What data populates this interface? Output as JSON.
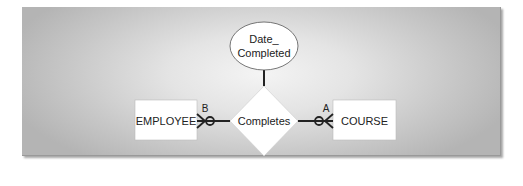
{
  "diagram": {
    "type": "ER diagram (crow's foot notation)",
    "entities": [
      {
        "id": "employee",
        "label": "EMPLOYEE"
      },
      {
        "id": "course",
        "label": "COURSE"
      }
    ],
    "relationship": {
      "id": "completes",
      "label": "Completes"
    },
    "attribute": {
      "id": "date_completed",
      "line1": "Date_",
      "line2": "Completed"
    },
    "cardinality_labels": {
      "employee_side": "B",
      "course_side": "A"
    },
    "connections": [
      {
        "from": "employee",
        "to": "completes",
        "notation": "optional-many (zero or more)",
        "label": "B"
      },
      {
        "from": "completes",
        "to": "course",
        "notation": "optional-many (zero or more)",
        "label": "A"
      },
      {
        "from": "date_completed",
        "to": "completes",
        "notation": "attribute-link"
      }
    ],
    "colors": {
      "shape_fill": "#ffffff",
      "line": "#222222",
      "panel_center": "#f4f4f4",
      "panel_edge": "#b4b4b4"
    }
  }
}
